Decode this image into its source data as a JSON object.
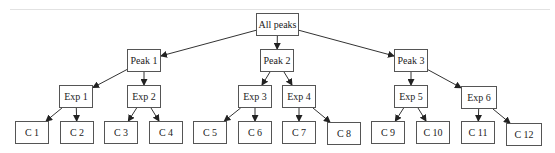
{
  "diagram": {
    "type": "tree",
    "root": "All peaks",
    "nodes": [
      {
        "id": "root",
        "label": "All peaks",
        "x": 256,
        "y": 13,
        "w": 43,
        "h": 23
      },
      {
        "id": "p1",
        "label": "Peak 1",
        "x": 127,
        "y": 49,
        "w": 34,
        "h": 23
      },
      {
        "id": "p2",
        "label": "Peak 2",
        "x": 260,
        "y": 49,
        "w": 34,
        "h": 23
      },
      {
        "id": "p3",
        "label": "Peak 3",
        "x": 394,
        "y": 49,
        "w": 34,
        "h": 23
      },
      {
        "id": "e1",
        "label": "Exp 1",
        "x": 59,
        "y": 85,
        "w": 34,
        "h": 23
      },
      {
        "id": "e2",
        "label": "Exp 2",
        "x": 127,
        "y": 85,
        "w": 34,
        "h": 23
      },
      {
        "id": "e3",
        "label": "Exp 3",
        "x": 238,
        "y": 85,
        "w": 34,
        "h": 23
      },
      {
        "id": "e4",
        "label": "Exp 4",
        "x": 282,
        "y": 85,
        "w": 34,
        "h": 23
      },
      {
        "id": "e5",
        "label": "Exp 5",
        "x": 394,
        "y": 85,
        "w": 34,
        "h": 23
      },
      {
        "id": "e6",
        "label": "Exp 6",
        "x": 461,
        "y": 86,
        "w": 36,
        "h": 23
      },
      {
        "id": "c1",
        "label": "C 1",
        "x": 15,
        "y": 121,
        "w": 34,
        "h": 23
      },
      {
        "id": "c2",
        "label": "C 2",
        "x": 60,
        "y": 121,
        "w": 34,
        "h": 23
      },
      {
        "id": "c3",
        "label": "C 3",
        "x": 104,
        "y": 121,
        "w": 34,
        "h": 23
      },
      {
        "id": "c4",
        "label": "C 4",
        "x": 149,
        "y": 121,
        "w": 34,
        "h": 23
      },
      {
        "id": "c5",
        "label": "C 5",
        "x": 193,
        "y": 121,
        "w": 34,
        "h": 23
      },
      {
        "id": "c6",
        "label": "C 6",
        "x": 238,
        "y": 121,
        "w": 34,
        "h": 23
      },
      {
        "id": "c7",
        "label": "C 7",
        "x": 282,
        "y": 121,
        "w": 34,
        "h": 23
      },
      {
        "id": "c8",
        "label": "C 8",
        "x": 327,
        "y": 122,
        "w": 34,
        "h": 23
      },
      {
        "id": "c9",
        "label": "C 9",
        "x": 371,
        "y": 121,
        "w": 34,
        "h": 23
      },
      {
        "id": "c10",
        "label": "C 10",
        "x": 416,
        "y": 121,
        "w": 34,
        "h": 23
      },
      {
        "id": "c11",
        "label": "C 11",
        "x": 461,
        "y": 121,
        "w": 34,
        "h": 23
      },
      {
        "id": "c12",
        "label": "C 12",
        "x": 506,
        "y": 123,
        "w": 36,
        "h": 23
      }
    ],
    "edges": [
      [
        "root",
        "p1"
      ],
      [
        "root",
        "p2"
      ],
      [
        "root",
        "p3"
      ],
      [
        "p1",
        "e1"
      ],
      [
        "p1",
        "e2"
      ],
      [
        "p2",
        "e3"
      ],
      [
        "p2",
        "e4"
      ],
      [
        "p3",
        "e5"
      ],
      [
        "p3",
        "e6"
      ],
      [
        "e1",
        "c1"
      ],
      [
        "e1",
        "c2"
      ],
      [
        "e2",
        "c3"
      ],
      [
        "e2",
        "c4"
      ],
      [
        "e3",
        "c5"
      ],
      [
        "e3",
        "c6"
      ],
      [
        "e4",
        "c7"
      ],
      [
        "e4",
        "c8"
      ],
      [
        "e5",
        "c9"
      ],
      [
        "e5",
        "c10"
      ],
      [
        "e6",
        "c11"
      ],
      [
        "e6",
        "c12"
      ]
    ]
  }
}
